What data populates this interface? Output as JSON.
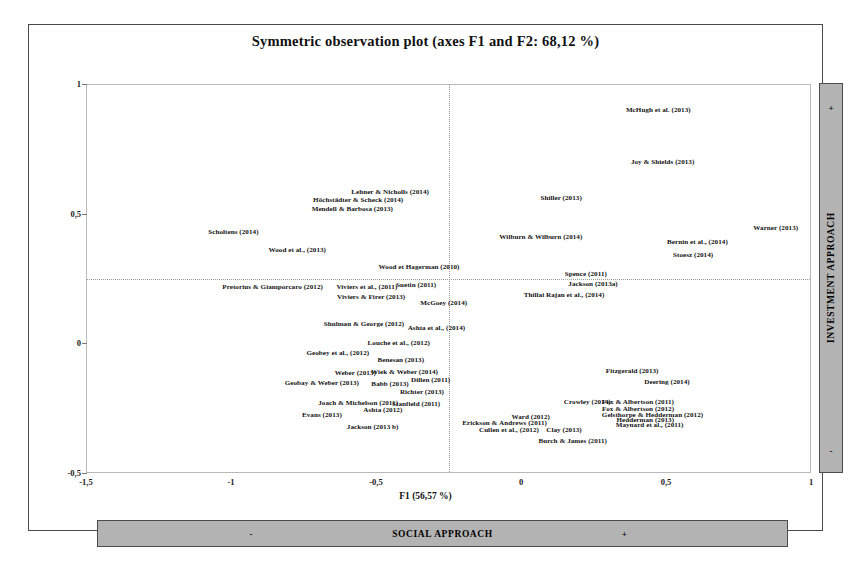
{
  "chart_data": {
    "type": "scatter",
    "title": "Symmetric observation plot (axes F1 and F2: 68,12 %)",
    "xlabel": "F1 (56,57 %)",
    "ylabel": "",
    "xlim": [
      -1.5,
      1.0
    ],
    "ylim": [
      -0.5,
      1.0
    ],
    "xticks": [
      "-1,5",
      "-1",
      "-0,5",
      "0",
      "0,5",
      "1"
    ],
    "xtick_values": [
      -1.5,
      -1,
      -0.5,
      0,
      0.5,
      1
    ],
    "yticks": [
      "1",
      "0,5",
      "0",
      "-0,5"
    ],
    "ytick_values": [
      1,
      0.5,
      0,
      -0.5
    ],
    "grid": "dotted crosshair at x=0 and y=0",
    "legend": "none",
    "marker_style": "text-labels-only",
    "points": [
      {
        "label": "McHugh et al.  (2013)",
        "x": 0.47,
        "y": 0.905
      },
      {
        "label": "Joy & Shields  (2013)",
        "x": 0.485,
        "y": 0.705
      },
      {
        "label": "Lehner & Nicholls (2014)",
        "x": -0.455,
        "y": 0.588
      },
      {
        "label": "Höchstädter & Scheck (2014)",
        "x": -0.565,
        "y": 0.555
      },
      {
        "label": "Shiller (2013)",
        "x": 0.135,
        "y": 0.565
      },
      {
        "label": "Mendell & Barbosa (2013)",
        "x": -0.585,
        "y": 0.522
      },
      {
        "label": "Warner (2013)",
        "x": 0.875,
        "y": 0.447
      },
      {
        "label": "Scholtens (2014)",
        "x": -0.995,
        "y": 0.432
      },
      {
        "label": "Wilburn & Wilburn (2014)",
        "x": 0.065,
        "y": 0.415
      },
      {
        "label": "Bernin et al., (2014)",
        "x": 0.605,
        "y": 0.395
      },
      {
        "label": "Wood et al., (2013)",
        "x": -0.775,
        "y": 0.363
      },
      {
        "label": "Stoesz (2014)",
        "x": 0.59,
        "y": 0.345
      },
      {
        "label": "Wood et Hagerman (2010)",
        "x": -0.355,
        "y": 0.298
      },
      {
        "label": "Spence (2011)",
        "x": 0.22,
        "y": 0.272
      },
      {
        "label": "Pretorius & Giamporcaro (2012)",
        "x": -0.86,
        "y": 0.222
      },
      {
        "label": "Viviers et al., (2011)",
        "x": -0.535,
        "y": 0.222
      },
      {
        "label": "Suetin (2011)",
        "x": -0.365,
        "y": 0.228
      },
      {
        "label": "Jackson (2013a)",
        "x": 0.245,
        "y": 0.232
      },
      {
        "label": "Thillai Rajan et al., (2014)",
        "x": 0.145,
        "y": 0.19
      },
      {
        "label": "Viviers & Firer (2013)",
        "x": -0.52,
        "y": 0.182
      },
      {
        "label": "McGoey (2014)",
        "x": -0.27,
        "y": 0.158
      },
      {
        "label": "Shulman & George (2012)",
        "x": -0.545,
        "y": 0.078
      },
      {
        "label": "Ashta et al., (2014)",
        "x": -0.295,
        "y": 0.062
      },
      {
        "label": "Louche et al., (2012)",
        "x": -0.425,
        "y": 0.005
      },
      {
        "label": "Geobey et al., (2012)",
        "x": -0.635,
        "y": -0.032
      },
      {
        "label": "Benesan (2013)",
        "x": -0.418,
        "y": -0.062
      },
      {
        "label": "Wiek & Weber  (2014)",
        "x": -0.405,
        "y": -0.105
      },
      {
        "label": "Weber (2013)",
        "x": -0.575,
        "y": -0.11
      },
      {
        "label": "Fitzgerald (2013)",
        "x": 0.38,
        "y": -0.102
      },
      {
        "label": "Geobay & Weber (2013)",
        "x": -0.69,
        "y": -0.148
      },
      {
        "label": "Dillen (2011)",
        "x": -0.315,
        "y": -0.138
      },
      {
        "label": "Babb (2013)",
        "x": -0.455,
        "y": -0.152
      },
      {
        "label": "Deering (2014)",
        "x": 0.5,
        "y": -0.145
      },
      {
        "label": "Richter (2013)",
        "x": -0.345,
        "y": -0.185
      },
      {
        "label": "Joach & Michelson (2011)",
        "x": -0.565,
        "y": -0.225
      },
      {
        "label": "Crowley (2014)",
        "x": 0.225,
        "y": -0.222
      },
      {
        "label": "Fox & Albertson  (2011)",
        "x": 0.4,
        "y": -0.222
      },
      {
        "label": "Stanfield (2011)",
        "x": -0.365,
        "y": -0.232
      },
      {
        "label": "Fox & Albertson  (2012)",
        "x": 0.4,
        "y": -0.248
      },
      {
        "label": "Ashta  (2012)",
        "x": -0.48,
        "y": -0.252
      },
      {
        "label": "Evans (2013)",
        "x": -0.69,
        "y": -0.272
      },
      {
        "label": "Gelsthorpe & Hedderman (2012)",
        "x": 0.45,
        "y": -0.272
      },
      {
        "label": "Ward (2012)",
        "x": 0.03,
        "y": -0.282
      },
      {
        "label": "Hedderman (2013)",
        "x": 0.425,
        "y": -0.292
      },
      {
        "label": "Erickson & Andrews (2011)",
        "x": -0.06,
        "y": -0.302
      },
      {
        "label": "Maynard et al.,  (2011)",
        "x": 0.44,
        "y": -0.312
      },
      {
        "label": "Jackson (2013 b)",
        "x": -0.515,
        "y": -0.318
      },
      {
        "label": "Cullen et al., (2012)",
        "x": -0.045,
        "y": -0.332
      },
      {
        "label": "Clay (2013)",
        "x": 0.145,
        "y": -0.332
      },
      {
        "label": "Burch & James (2011)",
        "x": 0.175,
        "y": -0.372
      }
    ]
  },
  "banners": {
    "bottom": {
      "text": "SOCIAL APPROACH",
      "minus": "-",
      "plus": "+"
    },
    "right": {
      "text": "INVESTMENT APPROACH",
      "minus": "-",
      "plus": "+"
    }
  }
}
